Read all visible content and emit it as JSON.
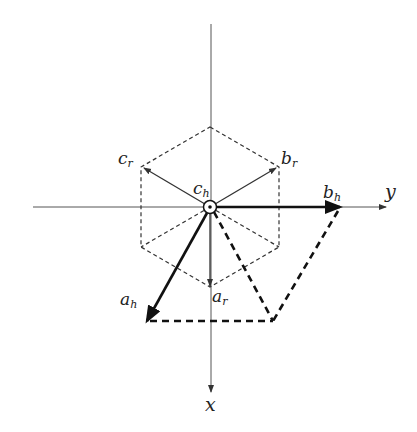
{
  "diagram": {
    "type": "phasor-vector-diagram",
    "axes": {
      "horizontal": {
        "label": "y"
      },
      "vertical": {
        "label": "x"
      }
    },
    "vectors": [
      {
        "name": "a_r",
        "base": "a",
        "sub": "r",
        "style": "thin"
      },
      {
        "name": "b_r",
        "base": "b",
        "sub": "r",
        "style": "thin"
      },
      {
        "name": "c_r",
        "base": "c",
        "sub": "r",
        "style": "thin"
      },
      {
        "name": "a_h",
        "base": "a",
        "sub": "h",
        "style": "bold"
      },
      {
        "name": "b_h",
        "base": "b",
        "sub": "h",
        "style": "bold"
      },
      {
        "name": "c_h",
        "base": "c",
        "sub": "h",
        "style": "out-of-plane (dot-in-circle)"
      }
    ],
    "hexagon": {
      "style": "dashed"
    },
    "construction": {
      "style": "bold-dashed",
      "description": "parallelogram of a_h and b_h"
    }
  },
  "colors": {
    "line": "#222222",
    "axis": "#555555",
    "background": "#ffffff"
  }
}
